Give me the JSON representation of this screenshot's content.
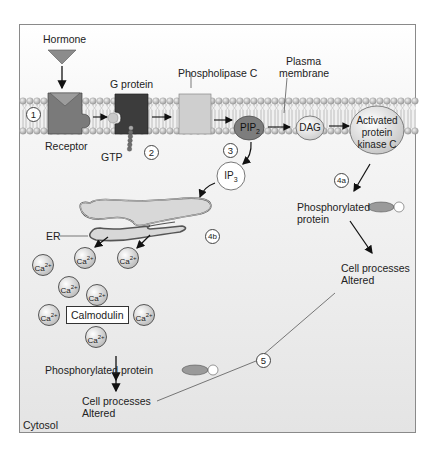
{
  "figure": {
    "regions": {
      "membrane_label": "Plasma\nmembrane",
      "cytosol_label": "Cytosol"
    },
    "ligand": {
      "label": "Hormone"
    },
    "membrane_components": {
      "receptor": "Receptor",
      "g_protein": "G protein",
      "gtp": "GTP",
      "phospholipase": "Phospholipase C",
      "pip2": "PIP",
      "pip2_sub": "2",
      "dag": "DAG",
      "pkc_line1": "Activated",
      "pkc_line2": "protein",
      "pkc_line3": "kinase C",
      "plasma_line1": "Plasma",
      "plasma_line2": "membrane"
    },
    "cytosol_components": {
      "ip3": "IP",
      "ip3_sub": "3",
      "er": "ER",
      "calcium": "Ca",
      "calcium_charge": "2+",
      "calmodulin": "Calmodulin",
      "phos_protein_right_line1": "Phosphorylated",
      "phos_protein_right_line2": "protein",
      "cell_proc_right_line1": "Cell processes",
      "cell_proc_right_line2": "Altered",
      "phos_protein_left": "Phosphorylated protein",
      "cell_proc_left_line1": "Cell processes",
      "cell_proc_left_line2": "Altered",
      "cytosol": "Cytosol"
    },
    "steps": [
      "1",
      "2",
      "3",
      "4a",
      "4b",
      "5"
    ],
    "colors": {
      "hormone": "#8c8c8c",
      "receptor": "#7a7a7a",
      "g_protein": "#3c3c3c",
      "phospholipase": "#cfcfcf",
      "pip2": "#7d7d7d",
      "dag": "#e0e0e0",
      "pkc": "#dcdcdc",
      "lipid_head": "#b5b5b5",
      "frame_border": "#8a8a8a"
    }
  }
}
